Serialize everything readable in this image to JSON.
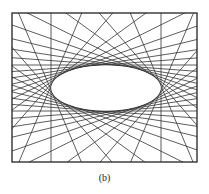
{
  "figure": {
    "caption": "(b)",
    "frame": {
      "x1": 12,
      "y1": 13,
      "x2": 197,
      "y2": 162
    },
    "ellipse": {
      "cx": 106,
      "cy": 88,
      "rx": 55,
      "ry": 23
    },
    "tangent_count": 36,
    "colors": {
      "line": "#333333",
      "frame": "#222222",
      "background": "#ffffff"
    }
  }
}
